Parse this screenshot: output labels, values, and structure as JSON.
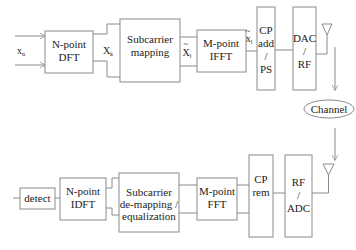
{
  "diagram": {
    "type": "block-diagram",
    "colors": {
      "stroke": "#8a8a8a",
      "text": "#222222",
      "background": "#ffffff"
    },
    "transmitter": {
      "input_label": {
        "main": "x",
        "sub": "n"
      },
      "blocks": [
        {
          "id": "n-point-dft",
          "lines": [
            "N-point",
            "DFT"
          ]
        },
        {
          "id": "subcarrier-mapping",
          "lines": [
            "Subcarrier",
            "mapping"
          ]
        },
        {
          "id": "m-point-ifft",
          "lines": [
            "M-point",
            "IFFT"
          ]
        },
        {
          "id": "cp-add-ps",
          "lines": [
            "CP",
            "add",
            "/",
            "PS"
          ]
        },
        {
          "id": "dac-rf",
          "lines": [
            "DAC",
            "/",
            "RF"
          ]
        }
      ],
      "signals": [
        {
          "id": "Xk",
          "main": "X",
          "sub": "k",
          "tilde": false
        },
        {
          "id": "Xl-tilde",
          "main": "X",
          "sub": "l",
          "tilde": true
        },
        {
          "id": "xl-tilde",
          "main": "x",
          "sub": "l",
          "tilde": true
        }
      ]
    },
    "channel": {
      "label": "Channel"
    },
    "receiver": {
      "blocks": [
        {
          "id": "rf-adc",
          "lines": [
            "RF",
            "/",
            "ADC"
          ]
        },
        {
          "id": "cp-rem",
          "lines": [
            "CP",
            "rem"
          ]
        },
        {
          "id": "m-point-fft",
          "lines": [
            "M-point",
            "FFT"
          ]
        },
        {
          "id": "subcarrier-demapping-equalization",
          "lines": [
            "Subcarrier",
            "de-mapping /",
            "equalization"
          ]
        },
        {
          "id": "n-point-idft",
          "lines": [
            "N-point",
            "IDFT"
          ]
        },
        {
          "id": "detect",
          "lines": [
            "detect"
          ]
        }
      ]
    }
  }
}
